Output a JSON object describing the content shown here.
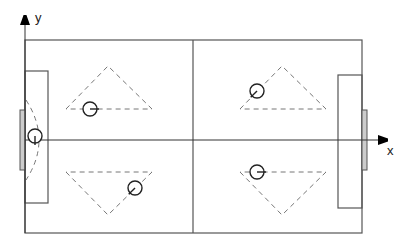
{
  "diagram": {
    "type": "soccer-field-formation",
    "colors": {
      "line": "#555555",
      "dashed": "#777777",
      "goal_fill": "#cccccc",
      "player": "#222222",
      "axis": "#333333"
    },
    "axes": {
      "x_label": "x",
      "y_label": "y"
    },
    "field": {
      "left": 25,
      "top": 40,
      "right": 362,
      "bottom": 233,
      "halfway_x": 193
    },
    "penalty_boxes": [
      {
        "side": "left",
        "x": 25,
        "y": 71,
        "w": 23,
        "h": 132
      },
      {
        "side": "right",
        "x": 338,
        "y": 75,
        "w": 24,
        "h": 133
      }
    ],
    "goals": [
      {
        "side": "left",
        "x": 20,
        "y": 110,
        "w": 5,
        "h": 60
      },
      {
        "side": "right",
        "x": 362,
        "y": 110,
        "w": 5,
        "h": 60
      }
    ],
    "triangles": [
      {
        "name": "top-left",
        "points": [
          [
            66,
            109
          ],
          [
            108,
            66
          ],
          [
            152,
            109
          ]
        ],
        "closed": true
      },
      {
        "name": "bottom-left",
        "points": [
          [
            66,
            172
          ],
          [
            108,
            215
          ],
          [
            152,
            172
          ]
        ],
        "closed": true
      },
      {
        "name": "top-right",
        "points": [
          [
            240,
            109
          ],
          [
            282,
            66
          ],
          [
            326,
            109
          ]
        ],
        "closed": true
      },
      {
        "name": "bottom-right",
        "points": [
          [
            240,
            172
          ],
          [
            282,
            215
          ],
          [
            326,
            172
          ]
        ],
        "closed": true
      }
    ],
    "players": [
      {
        "name": "goalkeeper",
        "cx": 35,
        "cy": 136,
        "r": 7,
        "dir": [
          0,
          1
        ]
      },
      {
        "name": "defender-top",
        "cx": 90,
        "cy": 109,
        "r": 7,
        "dir": [
          1,
          0
        ]
      },
      {
        "name": "defender-bottom",
        "cx": 135,
        "cy": 188,
        "r": 7,
        "dir": [
          -0.7,
          0.7
        ]
      },
      {
        "name": "attacker-top",
        "cx": 257,
        "cy": 91,
        "r": 7,
        "dir": [
          -0.7,
          0.7
        ]
      },
      {
        "name": "attacker-bottom",
        "cx": 257,
        "cy": 172,
        "r": 7,
        "dir": [
          1,
          0
        ]
      }
    ]
  }
}
